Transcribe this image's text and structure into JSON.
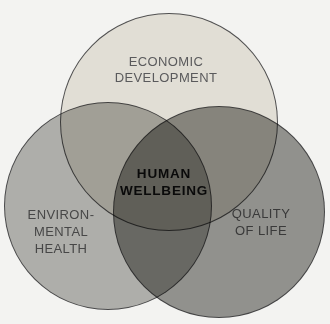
{
  "diagram": {
    "type": "venn",
    "background_color": "#f3f3f1",
    "outline_color": "#3a3a3c",
    "circles": [
      {
        "name": "economic-development",
        "label": "ECONOMIC\nDEVELOPMENT",
        "fill": "#ece9e2",
        "text_color": "#5a5a5c"
      },
      {
        "name": "environmental-health",
        "label": "ENVIRON-\nMENTAL\nHEALTH",
        "fill": "#b7b7b4",
        "text_color": "#474747"
      },
      {
        "name": "quality-of-life",
        "label": "QUALITY\nOF LIFE",
        "fill": "#989895",
        "text_color": "#3a3a3a"
      }
    ],
    "center_overlap": {
      "label": "HUMAN\nWELLBEING",
      "text_color": "#0a0a0a"
    }
  }
}
